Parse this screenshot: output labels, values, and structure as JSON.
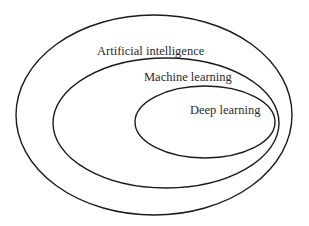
{
  "diagram": {
    "type": "nested-venn",
    "sets": [
      {
        "label": "Artificial intelligence",
        "ellipse": {
          "cx": 154,
          "cy": 115,
          "rx": 138,
          "ry": 100
        },
        "label_pos": {
          "x": 97,
          "y": 55
        }
      },
      {
        "label": "Machine learning",
        "ellipse": {
          "cx": 166,
          "cy": 123,
          "rx": 113,
          "ry": 65
        },
        "label_pos": {
          "x": 144,
          "y": 81
        }
      },
      {
        "label": "Deep learning",
        "ellipse": {
          "cx": 205,
          "cy": 122,
          "rx": 70,
          "ry": 36
        },
        "label_pos": {
          "x": 190,
          "y": 114
        }
      }
    ],
    "stroke_color": "#1a1a1a",
    "background": "#ffffff"
  }
}
